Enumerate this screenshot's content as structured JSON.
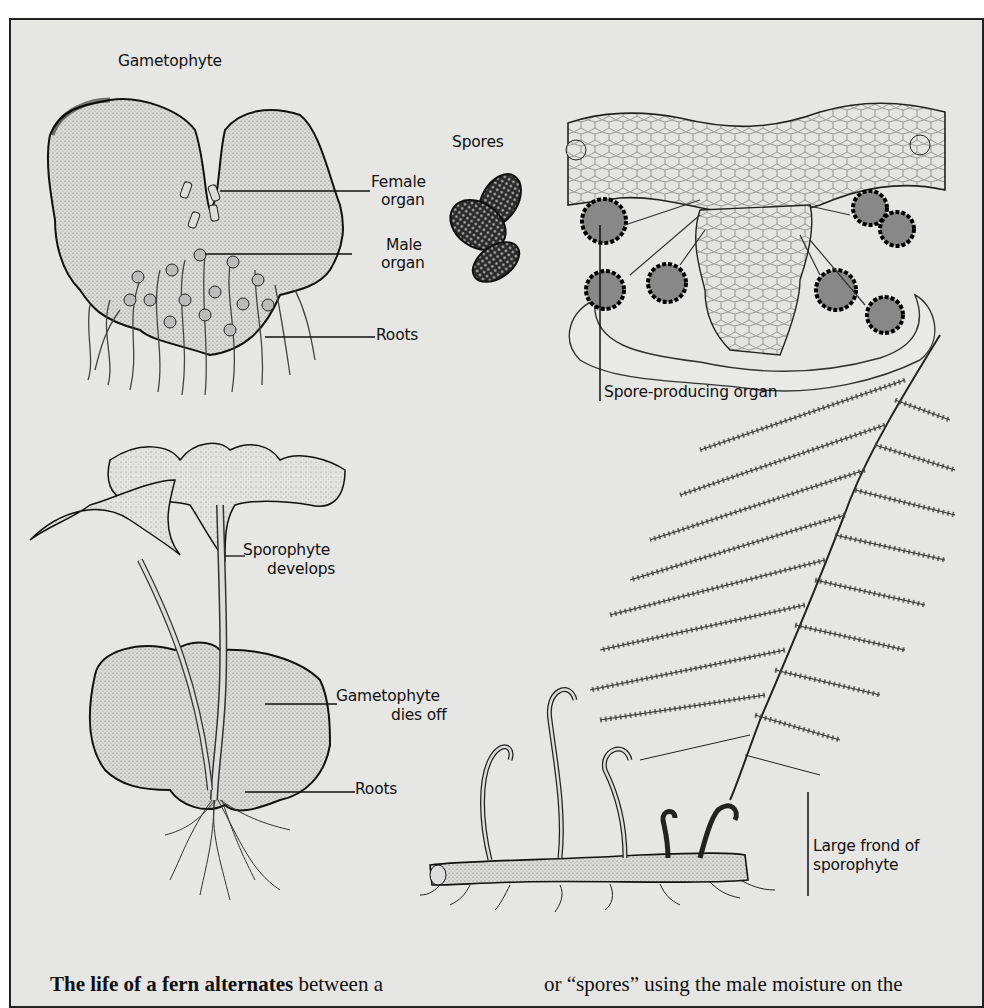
{
  "figure": {
    "background": "#e6e6e4",
    "border_color": "#222222",
    "labels": {
      "gametophyte": "Gametophyte",
      "female_organ_1": "Female",
      "female_organ_2": "organ",
      "male_organ_1": "Male",
      "male_organ_2": "organ",
      "roots_top": "Roots",
      "spores": "Spores",
      "spore_producing_organ": "Spore-producing organ",
      "sporophyte_develops_1": "Sporophyte",
      "sporophyte_develops_2": "develops",
      "gametophyte_dies_off_1": "Gametophyte",
      "gametophyte_dies_off_2": "dies off",
      "roots_bottom": "Roots",
      "large_frond_1": "Large frond of",
      "large_frond_2": "sporophyte"
    }
  },
  "caption": {
    "lead_bold": "The life of a fern alternates",
    "lead_rest": " between a",
    "col2": "or “spores” using the male moisture on the"
  }
}
